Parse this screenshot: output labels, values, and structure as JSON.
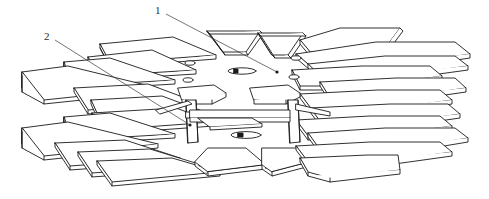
{
  "figure": {
    "style": "technical-line-drawing",
    "background_color": "#ffffff",
    "line_color": "#1a1a1a",
    "label_color": "#2b2b2b",
    "width": 489,
    "height": 199
  },
  "callouts": [
    {
      "id": "1",
      "label": "1",
      "label_x": 155,
      "label_y": 5,
      "leader_start_x": 166,
      "leader_start_y": 14,
      "leader_end_x": 277,
      "leader_end_y": 72,
      "dot_x": 277,
      "dot_y": 72,
      "target": "central-hub"
    },
    {
      "id": "2",
      "label": "2",
      "label_x": 44,
      "label_y": 31,
      "leader_start_x": 55,
      "leader_start_y": 40,
      "leader_end_x": 190,
      "leader_end_y": 125,
      "dot_x": 190,
      "dot_y": 125,
      "target": "vertical-support-post"
    }
  ],
  "components": {
    "radial_plates_count": 16,
    "vertical_posts_count": 2,
    "hub_pin_count": 6,
    "description": "Star-shaped stack of flat rectangular plates radiating from a central hub, supported by two vertical posts"
  }
}
